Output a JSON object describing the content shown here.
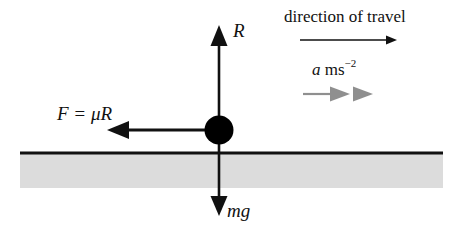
{
  "diagram": {
    "type": "force-diagram",
    "canvas": {
      "width": 459,
      "height": 240,
      "background": "#ffffff"
    },
    "colors": {
      "stroke": "#111111",
      "ground_fill": "#d9d9d9",
      "ground_line": "#111111",
      "particle": "#000000",
      "accel_arrow": "#8a8a8a"
    },
    "labels": {
      "direction_of_travel": "direction of travel",
      "acceleration_symbol": "a",
      "acceleration_unit": "ms",
      "acceleration_exponent": "−2",
      "normal_reaction": "R",
      "friction": "F = μR",
      "weight": "mg"
    },
    "elements": {
      "particle": {
        "cx": 219,
        "cy": 130,
        "r": 14
      },
      "ground": {
        "x": 20,
        "y": 153,
        "width": 423,
        "height": 35
      },
      "normal_arrow": {
        "x": 219,
        "y_start": 130,
        "y_end": 26,
        "direction": "up"
      },
      "weight_arrow": {
        "x": 219,
        "y_start": 130,
        "y_end": 215,
        "direction": "down"
      },
      "friction_arrow": {
        "y": 130,
        "x_start": 219,
        "x_end": 108,
        "direction": "left"
      },
      "travel_arrow": {
        "y": 40,
        "x_start": 300,
        "x_end": 396,
        "direction": "right"
      },
      "accel_arrow": {
        "y": 94,
        "x_start": 303,
        "x_end": 374,
        "direction": "right",
        "heads": 2
      }
    }
  }
}
